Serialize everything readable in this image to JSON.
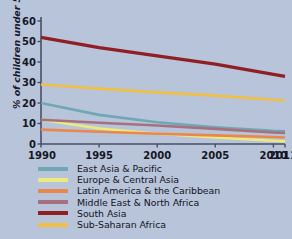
{
  "chart_data": {
    "type": "line",
    "title": "",
    "xlabel": "",
    "ylabel": "% of children under 5",
    "x": [
      1990,
      1995,
      2000,
      2005,
      2010,
      2011
    ],
    "xlim": [
      1990,
      2011
    ],
    "ylim": [
      0,
      60
    ],
    "ytick_labels": [
      "0",
      "10",
      "20",
      "30",
      "40",
      "50",
      "60"
    ],
    "yticks": [
      0,
      10,
      20,
      30,
      40,
      50,
      60
    ],
    "xtick_labels": [
      "1990",
      "1995",
      "2000",
      "2005",
      "2010",
      "2011"
    ],
    "grid": false,
    "legend_position": "below",
    "series": [
      {
        "name": "East Asia & Pacific",
        "color": "#6fa8b4",
        "values": [
          20.0,
          14.2,
          10.6,
          8.2,
          6.4,
          6.2
        ]
      },
      {
        "name": "Europe & Central Asia",
        "color": "#ecea7d",
        "values": [
          11.8,
          7.6,
          5.0,
          3.2,
          1.6,
          1.3
        ]
      },
      {
        "name": "Latin America & the Caribbean",
        "color": "#e8884a",
        "values": [
          7.0,
          6.0,
          5.0,
          4.2,
          3.4,
          3.2
        ]
      },
      {
        "name": "Middle East & North Africa",
        "color": "#a6707f",
        "values": [
          11.8,
          10.4,
          9.0,
          7.4,
          5.6,
          5.4
        ]
      },
      {
        "name": "South Asia",
        "color": "#8f1f22",
        "values": [
          52.0,
          47.0,
          43.0,
          39.0,
          34.0,
          33.0
        ]
      },
      {
        "name": "Sub-Saharan Africa",
        "color": "#f0bf44",
        "values": [
          29.0,
          27.0,
          25.2,
          23.6,
          21.6,
          21.2
        ]
      }
    ]
  },
  "colors": {
    "background": "#b8c4da",
    "axis": "#4a4f63",
    "text": "#16161f"
  }
}
